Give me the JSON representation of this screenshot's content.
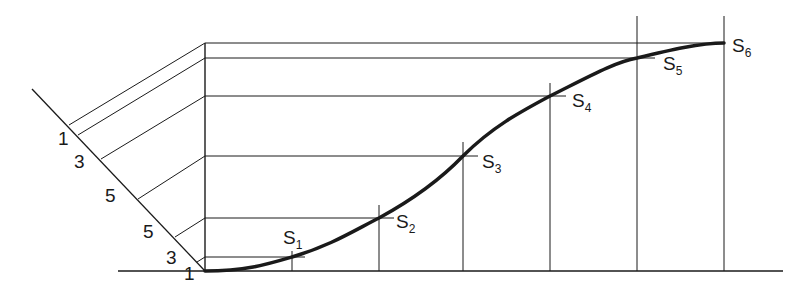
{
  "diagram": {
    "diagonal_scale_labels": [
      "1",
      "3",
      "5",
      "5",
      "3",
      "1"
    ],
    "points": [
      {
        "name": "S",
        "sub": "1"
      },
      {
        "name": "S",
        "sub": "2"
      },
      {
        "name": "S",
        "sub": "3"
      },
      {
        "name": "S",
        "sub": "4"
      },
      {
        "name": "S",
        "sub": "5"
      },
      {
        "name": "S",
        "sub": "6"
      }
    ],
    "colors": {
      "line": "#1a1a1a",
      "background": "#ffffff"
    }
  }
}
